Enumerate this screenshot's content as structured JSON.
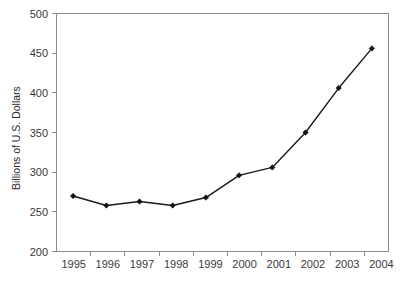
{
  "chart_data": {
    "type": "line",
    "title": "",
    "subtitle": "",
    "xlabel": "",
    "ylabel": "Billions of U.S. Dollars",
    "categories": [
      "1995",
      "1996",
      "1997",
      "1998",
      "1999",
      "2000",
      "2001",
      "2002",
      "2003",
      "2004"
    ],
    "values": [
      270,
      258,
      263,
      258,
      268,
      296,
      306,
      350,
      406,
      456
    ],
    "series": [
      {
        "name": "",
        "values": [
          270,
          258,
          263,
          258,
          268,
          296,
          306,
          350,
          406,
          456
        ]
      }
    ],
    "ylim": [
      200,
      500
    ],
    "ytick_labels": [
      "200",
      "250",
      "300",
      "350",
      "400",
      "450",
      "500"
    ],
    "ytick_values": [
      200,
      250,
      300,
      350,
      400,
      450,
      500
    ],
    "xtick_labels": [
      "1995",
      "1996",
      "1997",
      "1998",
      "1999",
      "2000",
      "2001",
      "2002",
      "2003",
      "2004"
    ],
    "grid": false,
    "legend": false,
    "legend_position": "none",
    "marker": "diamond",
    "line_color": "#1a1a1a",
    "marker_color": "#111111",
    "axis_color": "#8c8c8c",
    "background_color": "#ffffff"
  },
  "axis": {
    "y_title": "Billions of U.S. Dollars"
  }
}
